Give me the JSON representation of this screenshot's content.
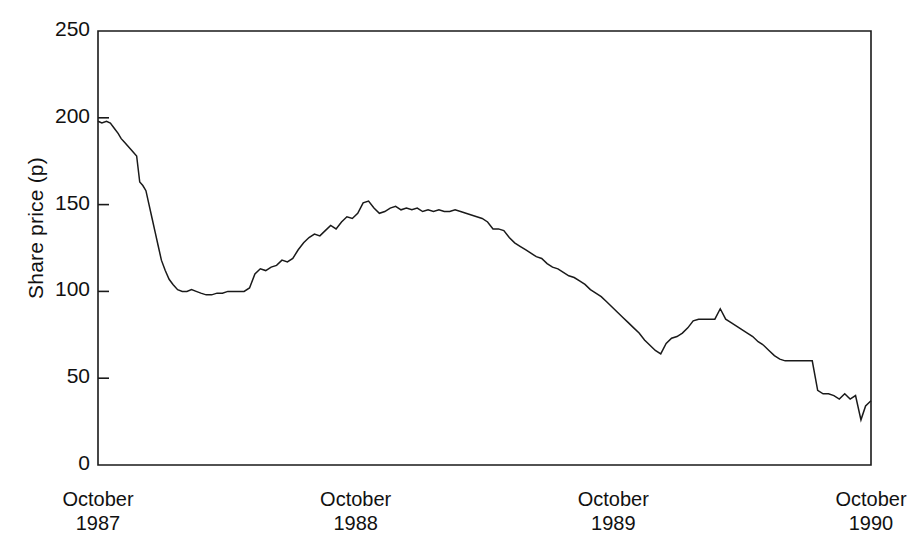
{
  "chart_data": {
    "type": "line",
    "title": "",
    "xlabel": "",
    "ylabel": "Share price (p)",
    "ylim": [
      0,
      250
    ],
    "yticks": [
      0,
      50,
      100,
      150,
      200,
      250
    ],
    "ytick_labels": [
      "0",
      "50",
      "100",
      "150",
      "200",
      "250"
    ],
    "grid": false,
    "legend": "none",
    "x_axis_type": "date",
    "xlim": [
      "1987-10",
      "1990-10"
    ],
    "xticks": [
      "1987-10",
      "1988-10",
      "1989-10",
      "1990-10"
    ],
    "xtick_labels": [
      {
        "month": "October",
        "year": "1987"
      },
      {
        "month": "October",
        "year": "1988"
      },
      {
        "month": "October",
        "year": "1989"
      },
      {
        "month": "October",
        "year": "1990"
      }
    ],
    "series": [
      {
        "name": "Share price",
        "color": "#1a1a1a",
        "units": "p",
        "x": [
          0.0,
          0.005,
          0.011,
          0.016,
          0.021,
          0.026,
          0.03,
          0.034,
          0.038,
          0.042,
          0.046,
          0.05,
          0.054,
          0.058,
          0.062,
          0.066,
          0.07,
          0.074,
          0.078,
          0.082,
          0.087,
          0.092,
          0.097,
          0.103,
          0.109,
          0.115,
          0.121,
          0.127,
          0.133,
          0.14,
          0.147,
          0.154,
          0.161,
          0.168,
          0.175,
          0.182,
          0.189,
          0.196,
          0.203,
          0.21,
          0.217,
          0.224,
          0.231,
          0.238,
          0.245,
          0.252,
          0.259,
          0.266,
          0.273,
          0.28,
          0.287,
          0.294,
          0.301,
          0.308,
          0.315,
          0.322,
          0.329,
          0.336,
          0.343,
          0.35,
          0.357,
          0.364,
          0.371,
          0.378,
          0.385,
          0.392,
          0.399,
          0.406,
          0.413,
          0.42,
          0.427,
          0.434,
          0.441,
          0.448,
          0.455,
          0.462,
          0.469,
          0.476,
          0.483,
          0.49,
          0.497,
          0.504,
          0.511,
          0.518,
          0.525,
          0.532,
          0.539,
          0.546,
          0.553,
          0.56,
          0.567,
          0.574,
          0.581,
          0.588,
          0.595,
          0.602,
          0.609,
          0.616,
          0.623,
          0.63,
          0.637,
          0.644,
          0.651,
          0.658,
          0.665,
          0.672,
          0.679,
          0.686,
          0.693,
          0.7,
          0.707,
          0.714,
          0.721,
          0.728,
          0.735,
          0.742,
          0.749,
          0.756,
          0.763,
          0.77,
          0.777,
          0.784,
          0.791,
          0.798,
          0.805,
          0.812,
          0.819,
          0.826,
          0.833,
          0.84,
          0.847,
          0.854,
          0.861,
          0.868,
          0.875,
          0.882,
          0.889,
          0.896,
          0.903,
          0.91,
          0.917,
          0.924,
          0.931,
          0.938,
          0.945,
          0.952,
          0.959,
          0.966,
          0.973,
          0.98,
          0.987,
          0.993,
          1.0
        ],
        "y": [
          198,
          197,
          198,
          197,
          194,
          191,
          188,
          186,
          184,
          182,
          180,
          178,
          163,
          161,
          158,
          150,
          142,
          134,
          126,
          118,
          112,
          107,
          104,
          101,
          100,
          100,
          101,
          100,
          99,
          98,
          98,
          99,
          99,
          100,
          100,
          100,
          100,
          102,
          110,
          113,
          112,
          114,
          115,
          118,
          117,
          119,
          124,
          128,
          131,
          133,
          132,
          135,
          138,
          136,
          140,
          143,
          142,
          145,
          151,
          152,
          148,
          145,
          146,
          148,
          149,
          147,
          148,
          147,
          148,
          146,
          147,
          146,
          147,
          146,
          146,
          147,
          146,
          145,
          144,
          143,
          142,
          140,
          136,
          136,
          135,
          131,
          128,
          126,
          124,
          122,
          120,
          119,
          116,
          114,
          113,
          111,
          109,
          108,
          106,
          104,
          101,
          99,
          97,
          94,
          91,
          88,
          85,
          82,
          79,
          76,
          72,
          69,
          66,
          64,
          70,
          73,
          74,
          76,
          79,
          83,
          84,
          84,
          84,
          84,
          90,
          84,
          82,
          80,
          78,
          76,
          74,
          71,
          69,
          66,
          63,
          61,
          60,
          60,
          60,
          60,
          60,
          60,
          43,
          41,
          41,
          40,
          38,
          41,
          38,
          40,
          26,
          34,
          37
        ]
      }
    ],
    "annotations": []
  },
  "figure": {
    "background": "#ffffff",
    "line_color": "#1a1a1a",
    "axis_color": "#1a1a1a",
    "text_color": "#111111"
  }
}
